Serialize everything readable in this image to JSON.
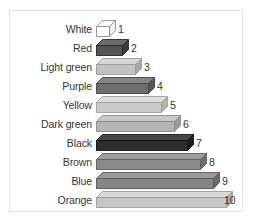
{
  "panel": {
    "background_color": "#ffffff",
    "border_color": "#e2e2e2"
  },
  "chart_data": {
    "type": "bar",
    "title": "",
    "subtitle": "",
    "xlabel": "",
    "ylabel": "",
    "orientation": "horizontal",
    "grid": false,
    "legend": false,
    "categories": [
      "White",
      "Red",
      "Light green",
      "Purple",
      "Yellow",
      "Dark green",
      "Black",
      "Brown",
      "Blue",
      "Orange"
    ],
    "values": [
      1,
      2,
      3,
      4,
      5,
      6,
      7,
      8,
      9,
      10
    ],
    "value_labels": [
      "1",
      "2",
      "3",
      "4",
      "5",
      "6",
      "7",
      "8",
      "9",
      "10"
    ],
    "xlim": [
      0,
      10
    ],
    "bars": [
      {
        "label": "White",
        "value": 1,
        "value_label": "1",
        "face_color": "#ffffff",
        "top_color": "#fafafa",
        "side_color": "#f0f0f0",
        "edge_color": "#8f8f8f"
      },
      {
        "label": "Red",
        "value": 2,
        "value_label": "2",
        "face_color": "#545454",
        "top_color": "#6b6b6b",
        "side_color": "#3d3d3d",
        "edge_color": "#2b2b2b"
      },
      {
        "label": "Light green",
        "value": 3,
        "value_label": "3",
        "face_color": "#c2c2c2",
        "top_color": "#d6d6d6",
        "side_color": "#a8a8a8",
        "edge_color": "#9a9a9a"
      },
      {
        "label": "Purple",
        "value": 4,
        "value_label": "4",
        "face_color": "#6e6e6e",
        "top_color": "#858585",
        "side_color": "#575757",
        "edge_color": "#444444"
      },
      {
        "label": "Yellow",
        "value": 5,
        "value_label": "5",
        "face_color": "#cacaca",
        "top_color": "#dddddd",
        "side_color": "#b0b0b0",
        "edge_color": "#a0a0a0"
      },
      {
        "label": "Dark green",
        "value": 6,
        "value_label": "6",
        "face_color": "#b4b4b4",
        "top_color": "#c8c8c8",
        "side_color": "#9a9a9a",
        "edge_color": "#8b8b8b"
      },
      {
        "label": "Black",
        "value": 7,
        "value_label": "7",
        "face_color": "#2e2e2e",
        "top_color": "#464646",
        "side_color": "#1d1d1d",
        "edge_color": "#121212"
      },
      {
        "label": "Brown",
        "value": 8,
        "value_label": "8",
        "face_color": "#8a8a8a",
        "top_color": "#9e9e9e",
        "side_color": "#707070",
        "edge_color": "#5f5f5f"
      },
      {
        "label": "Blue",
        "value": 9,
        "value_label": "9",
        "face_color": "#848484",
        "top_color": "#999999",
        "side_color": "#6a6a6a",
        "edge_color": "#595959"
      },
      {
        "label": "Orange",
        "value": 10,
        "value_label": "10",
        "face_color": "#c6c6c6",
        "top_color": "#d8d8d8",
        "side_color": "#acacac",
        "edge_color": "#9c9c9c"
      }
    ]
  }
}
